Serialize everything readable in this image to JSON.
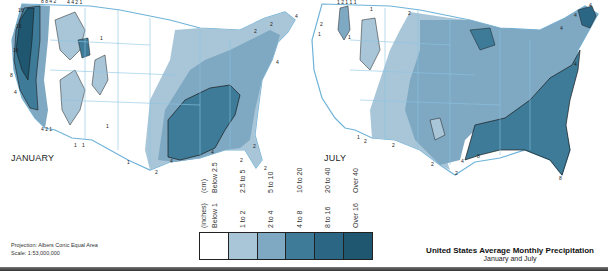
{
  "maps": {
    "january": {
      "title": "JANUARY",
      "contour_labels": [
        "16",
        "16",
        "16",
        "8",
        "4",
        "8",
        "8",
        "4",
        "2",
        "4",
        "4",
        "2",
        "1",
        "4",
        "2",
        "1",
        "1",
        "1",
        "1",
        "2",
        "4",
        "2",
        "4",
        "2",
        "2",
        "2",
        "4",
        "1"
      ]
    },
    "july": {
      "title": "JULY",
      "contour_labels": [
        "1",
        "2",
        "1",
        "1",
        "1",
        "1",
        "2",
        "1",
        "1",
        "2",
        "2",
        "4",
        "4",
        "4",
        "4",
        "4",
        "8",
        "2",
        "2",
        "4",
        "8",
        "1"
      ]
    }
  },
  "legend": {
    "header_inches": "(inches)",
    "header_cm": "(cm)",
    "classes": [
      {
        "inches": "Below 1",
        "cm": "Below 2.5",
        "color": "#ffffff"
      },
      {
        "inches": "1 to 2",
        "cm": "2.5 to 5",
        "color": "#a9c6d8"
      },
      {
        "inches": "2 to 4",
        "cm": "5 to 10",
        "color": "#7fa8c2"
      },
      {
        "inches": "4 to 8",
        "cm": "10 to 20",
        "color": "#3d7b98"
      },
      {
        "inches": "8 to 16",
        "cm": "20 to 40",
        "color": "#2b6784"
      },
      {
        "inches": "Over 16",
        "cm": "Over 40",
        "color": "#1f5670"
      }
    ]
  },
  "projection": {
    "line1": "Projection: Albers Conic Equal Area",
    "line2": "Scale: 1:53,000,000"
  },
  "caption": {
    "title": "United States Average Monthly Precipitation",
    "subtitle": "January and July"
  },
  "colors": {
    "water_outline": "#6fb3d9",
    "state_border": "#8cc4e3",
    "contour_line": "#1a1a1a"
  }
}
